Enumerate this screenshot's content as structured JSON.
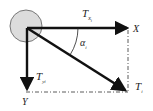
{
  "diagram": {
    "labels": {
      "x_axis": "X",
      "y_axis": "Y",
      "tx": "T",
      "tx_sub": "x",
      "tx_subsub": "i",
      "ty": "T",
      "ty_sub": "yi",
      "ti": "T",
      "ti_sub": "i",
      "alpha": "α",
      "alpha_sub": "i"
    },
    "colors": {
      "arrow": "#111111",
      "circle_fill": "#dcdcdc",
      "circle_stroke": "#777777",
      "dash": "#333333"
    }
  }
}
